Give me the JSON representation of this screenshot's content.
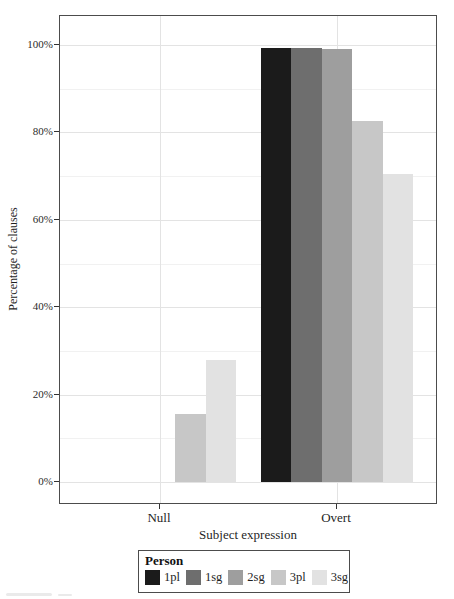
{
  "chart_data": {
    "type": "bar",
    "title": "",
    "xlabel": "Subject expression",
    "ylabel": "Percentage of clauses",
    "legend_title": "Person",
    "legend_position": "bottom",
    "grid": "major+minor",
    "categories": [
      "Null",
      "Overt"
    ],
    "series": [
      {
        "name": "1pl",
        "color": "#1b1b1b",
        "values": [
          0,
          99.4
        ]
      },
      {
        "name": "1sg",
        "color": "#6e6e6e",
        "values": [
          0,
          99.2
        ]
      },
      {
        "name": "2sg",
        "color": "#9e9e9e",
        "values": [
          0,
          99.0
        ]
      },
      {
        "name": "3pl",
        "color": "#c7c7c7",
        "values": [
          15.5,
          82.5
        ]
      },
      {
        "name": "3sg",
        "color": "#e2e2e2",
        "values": [
          28.0,
          70.5
        ]
      }
    ],
    "ylim": [
      0,
      100
    ],
    "yticks": [
      {
        "value": 0,
        "label": "0%"
      },
      {
        "value": 20,
        "label": "20%"
      },
      {
        "value": 40,
        "label": "40%"
      },
      {
        "value": 60,
        "label": "60%"
      },
      {
        "value": 80,
        "label": "80%"
      },
      {
        "value": 100,
        "label": "100%"
      }
    ],
    "yticks_minor": [
      10,
      30,
      50,
      70,
      90
    ]
  },
  "colors": {
    "panel_border": "#4c4c4c",
    "grid_major": "#e3e3e3",
    "grid_minor": "#f1f1f1",
    "tick": "#333333",
    "text": "#1a1a1a"
  }
}
